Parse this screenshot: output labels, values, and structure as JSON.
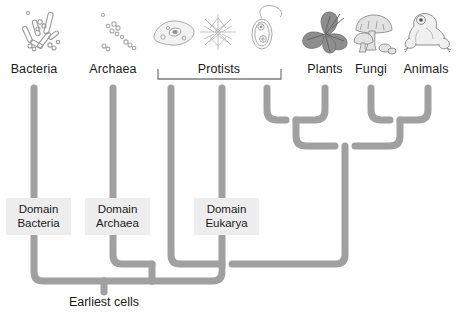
{
  "diagram": {
    "root_label": "Earliest cells",
    "branch_color": "#a0a0a0",
    "box_background": "#ededed",
    "text_color": "#1a1a1a",
    "background": "#ffffff"
  },
  "taxa": [
    {
      "key": "bacteria",
      "label": "Bacteria",
      "x": 34,
      "icon": "rod-bacteria-icon"
    },
    {
      "key": "archaea",
      "label": "Archaea",
      "x": 113,
      "icon": "cocci-archaea-icon"
    },
    {
      "key": "protists",
      "label": "Protists",
      "x": 219,
      "icon": "amoeba-protist-icon"
    },
    {
      "key": "plants",
      "label": "Plants",
      "x": 325,
      "icon": "leaf-plant-icon"
    },
    {
      "key": "fungi",
      "label": "Fungi",
      "x": 371,
      "icon": "mushroom-fungi-icon"
    },
    {
      "key": "animals",
      "label": "Animals",
      "x": 428,
      "icon": "frog-animal-icon"
    }
  ],
  "protist_bracket": {
    "label": "Protists",
    "left": 158,
    "right": 281,
    "y": 75
  },
  "domains": [
    {
      "key": "bacteria",
      "line1": "Domain",
      "line2": "Bacteria",
      "x": 34,
      "y": 198
    },
    {
      "key": "archaea",
      "line1": "Domain",
      "line2": "Archaea",
      "x": 113,
      "y": 198
    },
    {
      "key": "eukarya",
      "line1": "Domain",
      "line2": "Eukarya",
      "x": 222,
      "y": 198
    }
  ],
  "organism_illustrations": [
    {
      "key": "bacteria",
      "name": "rod-bacteria-icon",
      "label": "Bacteria"
    },
    {
      "key": "archaea",
      "name": "cocci-archaea-icon",
      "label": "Archaea"
    },
    {
      "key": "amoeba",
      "name": "amoeba-protist-icon",
      "label": "Amoeba"
    },
    {
      "key": "algae",
      "name": "algae-protist-icon",
      "label": "Algae"
    },
    {
      "key": "flagellate",
      "name": "flagellate-protist-icon",
      "label": "Flagellate"
    },
    {
      "key": "plant",
      "name": "leaf-plant-icon",
      "label": "Plant leaves"
    },
    {
      "key": "fungi",
      "name": "mushroom-fungi-icon",
      "label": "Mushrooms"
    },
    {
      "key": "animal",
      "name": "frog-animal-icon",
      "label": "Frog"
    }
  ]
}
